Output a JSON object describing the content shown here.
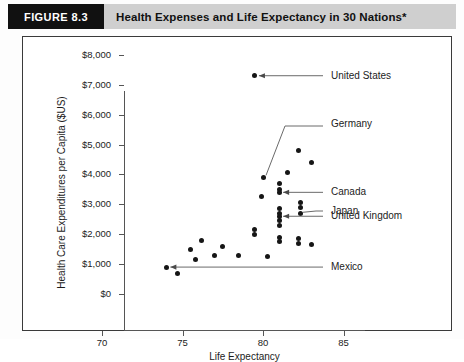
{
  "figure": {
    "badge": "FIGURE 8.3",
    "title": "Health Expenses and Life Expectancy in 30 Nations*"
  },
  "chart_data": {
    "type": "scatter",
    "title": "Health Expenses and Life Expectancy in 30 Nations*",
    "xlabel": "Life Expectancy",
    "ylabel": "Health Care Expenditures per Capita ($US)",
    "xlim": [
      70,
      85
    ],
    "ylim": [
      0,
      8000
    ],
    "xticks": [
      "70",
      "75",
      "80",
      "85"
    ],
    "xtick_values": [
      70,
      75,
      80,
      85
    ],
    "yticks": [
      "$0",
      "$1,000",
      "$2,000",
      "$3,000",
      "$4,000",
      "$5,000",
      "$6,000",
      "$7,000",
      "$8,000"
    ],
    "ytick_values": [
      0,
      1000,
      2000,
      3000,
      4000,
      5000,
      6000,
      7000,
      8000
    ],
    "grid": false,
    "legend": "none",
    "points": [
      {
        "x": 79.5,
        "y": 7300
      },
      {
        "x": 82.2,
        "y": 4800
      },
      {
        "x": 83.0,
        "y": 4400
      },
      {
        "x": 81.5,
        "y": 4050
      },
      {
        "x": 80.0,
        "y": 3900
      },
      {
        "x": 81.0,
        "y": 3700
      },
      {
        "x": 81.0,
        "y": 3500
      },
      {
        "x": 81.0,
        "y": 3400
      },
      {
        "x": 79.9,
        "y": 3250
      },
      {
        "x": 82.3,
        "y": 3050
      },
      {
        "x": 82.3,
        "y": 2900
      },
      {
        "x": 81.0,
        "y": 2850
      },
      {
        "x": 81.0,
        "y": 2700
      },
      {
        "x": 82.3,
        "y": 2700
      },
      {
        "x": 81.0,
        "y": 2600
      },
      {
        "x": 81.0,
        "y": 2450
      },
      {
        "x": 81.0,
        "y": 2300
      },
      {
        "x": 79.5,
        "y": 2150
      },
      {
        "x": 79.5,
        "y": 2000
      },
      {
        "x": 81.0,
        "y": 1900
      },
      {
        "x": 82.2,
        "y": 1850
      },
      {
        "x": 82.2,
        "y": 1700
      },
      {
        "x": 81.0,
        "y": 1750
      },
      {
        "x": 83.0,
        "y": 1650
      },
      {
        "x": 76.2,
        "y": 1800
      },
      {
        "x": 77.5,
        "y": 1600
      },
      {
        "x": 75.5,
        "y": 1500
      },
      {
        "x": 77.0,
        "y": 1300
      },
      {
        "x": 78.5,
        "y": 1300
      },
      {
        "x": 80.3,
        "y": 1250
      },
      {
        "x": 75.8,
        "y": 1150
      },
      {
        "x": 74.0,
        "y": 900
      },
      {
        "x": 74.7,
        "y": 700
      }
    ],
    "annotations": [
      {
        "label": "United States",
        "x": 79.5,
        "y": 7300
      },
      {
        "label": "Germany",
        "x": 80.0,
        "y": 3900
      },
      {
        "label": "Canada",
        "x": 81.0,
        "y": 3400
      },
      {
        "label": "Japan",
        "x": 82.3,
        "y": 2700
      },
      {
        "label": "United Kingdom",
        "x": 81.0,
        "y": 2600
      },
      {
        "label": "Mexico",
        "x": 74.0,
        "y": 900
      }
    ]
  }
}
